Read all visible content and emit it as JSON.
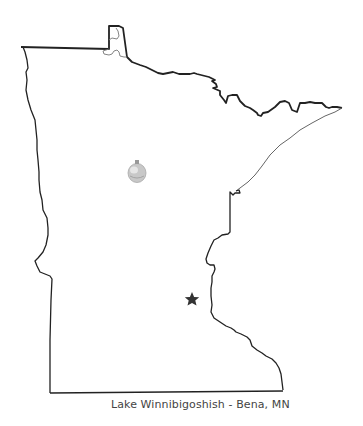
{
  "map": {
    "region": "Minnesota",
    "caption": "Lake Winnibigoshish - Bena, MN",
    "markers": [
      {
        "type": "star",
        "meaning": "capital-marker",
        "x": 192,
        "y": 299,
        "color": "#333333"
      },
      {
        "type": "ornament",
        "meaning": "location-marker",
        "x": 137,
        "y": 172,
        "color": "#bdbdbd"
      }
    ],
    "colors": {
      "outline": "#222222",
      "shoreline": "#666666",
      "background": "#ffffff"
    }
  }
}
